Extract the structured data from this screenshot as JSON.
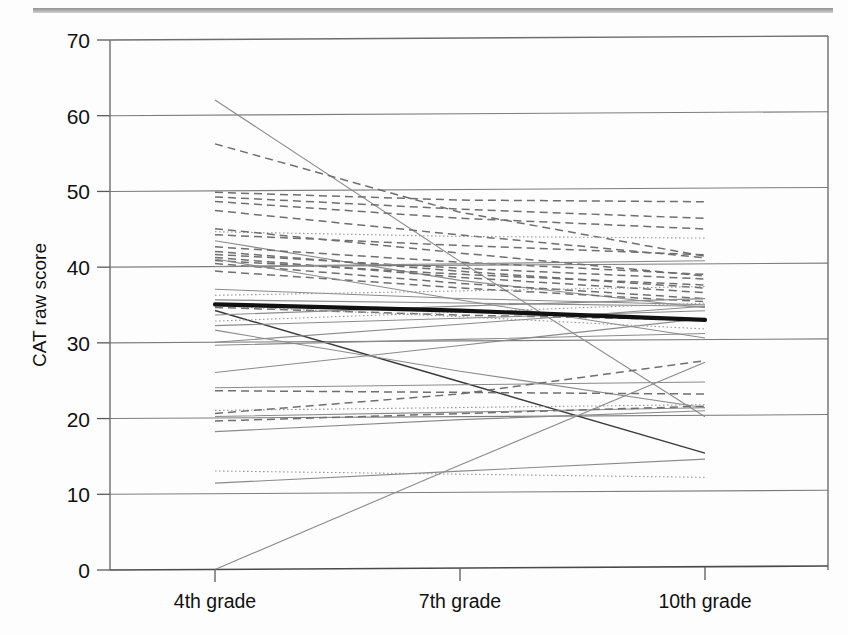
{
  "figure": {
    "kind": "line-chart-spaghetti-plot",
    "background_color": "#fdfdfd",
    "scan_rule_color": "#9a9a9a"
  },
  "chart_data": {
    "type": "line",
    "title": "",
    "subtitle": "",
    "xlabel": "",
    "ylabel": "CAT raw score",
    "categories": [
      "4th grade",
      "7th grade",
      "10th grade"
    ],
    "x_tick_labels": [
      "4th grade",
      "7th grade",
      "10th grade"
    ],
    "y_tick_labels": [
      "0",
      "10",
      "20",
      "30",
      "40",
      "50",
      "60",
      "70"
    ],
    "y_ticks": [
      0,
      10,
      20,
      30,
      40,
      50,
      60,
      70
    ],
    "ylim": [
      0,
      70
    ],
    "grid": "horizontal",
    "legend": "none",
    "legend_position": "none",
    "annotations": [],
    "styles": {
      "individual_solid": {
        "color": "#8b8b8b",
        "width": 1.1,
        "dash": "none"
      },
      "individual_dashed": {
        "color": "#6f6f6f",
        "width": 1.5,
        "dash": "8,5"
      },
      "individual_dotted": {
        "color": "#9a9a9a",
        "width": 1.1,
        "dash": "1.6,2.4"
      },
      "individual_dark": {
        "color": "#3a3a3a",
        "width": 1.4,
        "dash": "none"
      },
      "mean": {
        "color": "#111111",
        "width": 4.2,
        "dash": "none"
      }
    },
    "mean_series": {
      "name": "Group mean",
      "values": [
        35.0,
        34.0,
        32.6
      ],
      "style": "mean"
    },
    "series": [
      {
        "name": "case-01",
        "values": [
          62.0,
          40.5,
          19.8
        ],
        "style": "individual_solid"
      },
      {
        "name": "case-02",
        "values": [
          56.2,
          47.0,
          41.0
        ],
        "style": "individual_dashed"
      },
      {
        "name": "case-03",
        "values": [
          49.8,
          48.6,
          48.2
        ],
        "style": "individual_dashed"
      },
      {
        "name": "case-04",
        "values": [
          49.2,
          47.4,
          46.0
        ],
        "style": "individual_dashed"
      },
      {
        "name": "case-05",
        "values": [
          48.6,
          46.2,
          44.6
        ],
        "style": "individual_dashed"
      },
      {
        "name": "case-06",
        "values": [
          47.4,
          44.0,
          40.8
        ],
        "style": "individual_dashed"
      },
      {
        "name": "case-07",
        "values": [
          44.6,
          43.8,
          43.4
        ],
        "style": "individual_dotted"
      },
      {
        "name": "case-08",
        "values": [
          44.2,
          42.6,
          41.2
        ],
        "style": "individual_dashed"
      },
      {
        "name": "case-09",
        "values": [
          43.4,
          38.0,
          34.2
        ],
        "style": "individual_solid"
      },
      {
        "name": "case-10",
        "values": [
          42.6,
          40.4,
          38.6
        ],
        "style": "individual_dashed"
      },
      {
        "name": "case-11",
        "values": [
          42.0,
          39.2,
          36.8
        ],
        "style": "individual_dashed"
      },
      {
        "name": "case-12",
        "values": [
          41.6,
          39.6,
          38.0
        ],
        "style": "individual_dashed"
      },
      {
        "name": "case-13",
        "values": [
          41.2,
          38.4,
          36.2
        ],
        "style": "individual_dashed"
      },
      {
        "name": "case-14",
        "values": [
          40.8,
          38.8,
          37.2
        ],
        "style": "individual_dashed"
      },
      {
        "name": "case-15",
        "values": [
          40.4,
          37.6,
          35.4
        ],
        "style": "individual_dashed"
      },
      {
        "name": "case-16",
        "values": [
          40.0,
          40.2,
          40.4
        ],
        "style": "individual_solid"
      },
      {
        "name": "case-17",
        "values": [
          39.4,
          37.0,
          35.0
        ],
        "style": "individual_dashed"
      },
      {
        "name": "case-18",
        "values": [
          37.0,
          35.6,
          34.6
        ],
        "style": "individual_solid"
      },
      {
        "name": "case-19",
        "values": [
          36.2,
          36.6,
          37.0
        ],
        "style": "individual_dotted"
      },
      {
        "name": "case-20",
        "values": [
          35.6,
          35.0,
          34.4
        ],
        "style": "individual_solid"
      },
      {
        "name": "case-21",
        "values": [
          34.6,
          33.4,
          32.6
        ],
        "style": "individual_dashed"
      },
      {
        "name": "case-22",
        "values": [
          34.2,
          24.6,
          15.0
        ],
        "style": "individual_dark"
      },
      {
        "name": "case-23",
        "values": [
          33.6,
          34.6,
          35.4
        ],
        "style": "individual_solid"
      },
      {
        "name": "case-24",
        "values": [
          32.8,
          33.8,
          34.8
        ],
        "style": "individual_dotted"
      },
      {
        "name": "case-25",
        "values": [
          32.2,
          33.0,
          33.8
        ],
        "style": "individual_solid"
      },
      {
        "name": "case-26",
        "values": [
          31.6,
          26.0,
          21.0
        ],
        "style": "individual_solid"
      },
      {
        "name": "case-27",
        "values": [
          30.0,
          32.2,
          34.4
        ],
        "style": "individual_solid"
      },
      {
        "name": "case-28",
        "values": [
          29.6,
          30.2,
          30.8
        ],
        "style": "individual_solid"
      },
      {
        "name": "case-29",
        "values": [
          26.0,
          29.4,
          32.8
        ],
        "style": "individual_solid"
      },
      {
        "name": "case-30",
        "values": [
          24.0,
          24.2,
          24.4
        ],
        "style": "individual_solid"
      },
      {
        "name": "case-31",
        "values": [
          23.6,
          23.2,
          22.8
        ],
        "style": "individual_dashed"
      },
      {
        "name": "case-32",
        "values": [
          21.0,
          21.2,
          21.4
        ],
        "style": "individual_dotted"
      },
      {
        "name": "case-33",
        "values": [
          20.6,
          23.0,
          27.2
        ],
        "style": "individual_dashed"
      },
      {
        "name": "case-34",
        "values": [
          20.2,
          20.6,
          21.0
        ],
        "style": "individual_solid"
      },
      {
        "name": "case-35",
        "values": [
          19.6,
          20.4,
          21.2
        ],
        "style": "individual_dashed"
      },
      {
        "name": "case-36",
        "values": [
          18.2,
          19.6,
          20.6
        ],
        "style": "individual_solid"
      },
      {
        "name": "case-37",
        "values": [
          13.0,
          12.4,
          11.8
        ],
        "style": "individual_dotted"
      },
      {
        "name": "case-38",
        "values": [
          11.4,
          12.8,
          14.2
        ],
        "style": "individual_solid"
      },
      {
        "name": "case-39",
        "values": [
          0.0,
          13.6,
          27.0
        ],
        "style": "individual_solid"
      },
      {
        "name": "case-40",
        "values": [
          45.0,
          41.6,
          38.4
        ],
        "style": "individual_dashed"
      },
      {
        "name": "case-41",
        "values": [
          41.0,
          35.4,
          30.2
        ],
        "style": "individual_solid"
      },
      {
        "name": "case-42",
        "values": [
          34.8,
          33.2,
          31.4
        ],
        "style": "individual_dotted"
      }
    ]
  }
}
